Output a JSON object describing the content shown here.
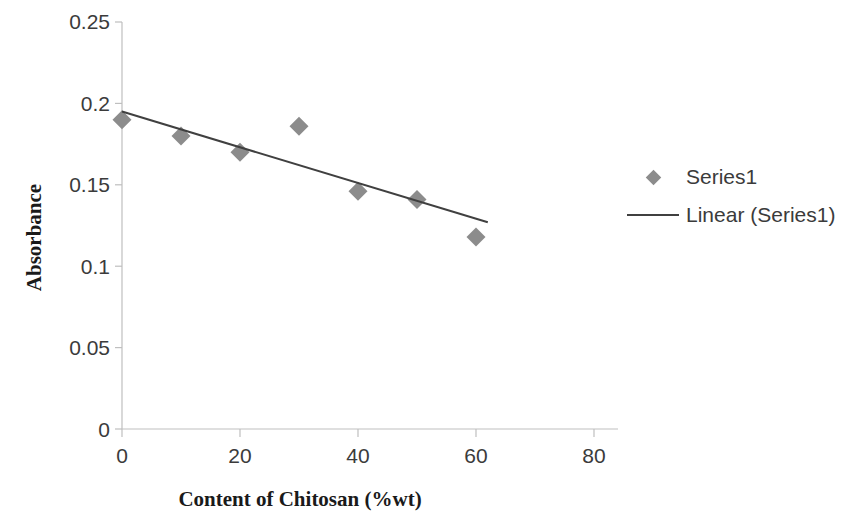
{
  "chart_data": {
    "type": "scatter",
    "title": "",
    "xlabel": "Content of Chitosan (%wt)",
    "ylabel": "Absorbance",
    "xlim": [
      0,
      80
    ],
    "ylim": [
      0,
      0.25
    ],
    "xticks": [
      "0",
      "20",
      "40",
      "60",
      "80"
    ],
    "xtick_values": [
      0,
      20,
      40,
      60,
      80
    ],
    "yticks": [
      "0",
      "0.05",
      "0.1",
      "0.15",
      "0.2",
      "0.25"
    ],
    "ytick_values": [
      0,
      0.05,
      0.1,
      0.15,
      0.2,
      0.25
    ],
    "grid": false,
    "legend_position": "right",
    "series": [
      {
        "name": "Series1",
        "kind": "scatter",
        "marker": "diamond",
        "color": "#8c8c8c",
        "x": [
          0,
          10,
          20,
          30,
          40,
          50,
          60
        ],
        "values": [
          0.19,
          0.18,
          0.17,
          0.186,
          0.146,
          0.141,
          0.118
        ]
      },
      {
        "name": "Linear (Series1)",
        "kind": "trendline",
        "color": "#404040",
        "x": [
          0,
          62
        ],
        "values": [
          0.195,
          0.127
        ]
      }
    ]
  },
  "legend": {
    "entries": [
      {
        "label": "Series1",
        "key": "diamond-marker"
      },
      {
        "label": "Linear (Series1)",
        "key": "line-marker"
      }
    ]
  },
  "axes": {
    "x_title": "Content of Chitosan (%wt)",
    "y_title": "Absorbance",
    "x_tick_labels": [
      "0",
      "20",
      "40",
      "60",
      "80"
    ],
    "y_tick_labels": [
      "0.25",
      "0.2",
      "0.15",
      "0.1",
      "0.05",
      "0"
    ]
  },
  "colors": {
    "marker": "#8c8c8c",
    "trendline": "#404040",
    "axis": "#bfbfbf",
    "tick_text": "#3b3b3b",
    "title_text": "#1a1a1a",
    "background": "#ffffff"
  }
}
